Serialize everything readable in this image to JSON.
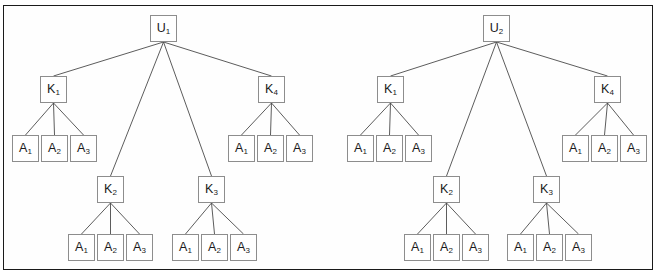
{
  "figure": {
    "frame": {
      "border_color": "#1a1a1a",
      "background": "#fefefe"
    },
    "node_style": {
      "border_color": "#8d8d8d",
      "fill": "#ffffff",
      "text_color": "#1a1a1a",
      "edge_color": "#4a4a4a"
    },
    "trees": [
      {
        "id": "tree-left",
        "root": {
          "id": "u1",
          "label": "U",
          "sub": "1",
          "x": 150,
          "y": 15
        },
        "k_nodes": [
          {
            "id": "l-k1",
            "label": "K",
            "sub": "1",
            "x": 40,
            "y": 76,
            "children": [
              {
                "label": "A",
                "sub": "1",
                "x": 12,
                "y": 135
              },
              {
                "label": "A",
                "sub": "2",
                "x": 41,
                "y": 135
              },
              {
                "label": "A",
                "sub": "3",
                "x": 70,
                "y": 135
              }
            ]
          },
          {
            "id": "l-k2",
            "label": "K",
            "sub": "2",
            "x": 97,
            "y": 176,
            "children": [
              {
                "label": "A",
                "sub": "1",
                "x": 68,
                "y": 234
              },
              {
                "label": "A",
                "sub": "2",
                "x": 97,
                "y": 234
              },
              {
                "label": "A",
                "sub": "3",
                "x": 126,
                "y": 234
              }
            ]
          },
          {
            "id": "l-k3",
            "label": "K",
            "sub": "3",
            "x": 198,
            "y": 176,
            "children": [
              {
                "label": "A",
                "sub": "1",
                "x": 172,
                "y": 234
              },
              {
                "label": "A",
                "sub": "2",
                "x": 201,
                "y": 234
              },
              {
                "label": "A",
                "sub": "3",
                "x": 230,
                "y": 234
              }
            ]
          },
          {
            "id": "l-k4",
            "label": "K",
            "sub": "4",
            "x": 258,
            "y": 76,
            "children": [
              {
                "label": "A",
                "sub": "1",
                "x": 228,
                "y": 135
              },
              {
                "label": "A",
                "sub": "2",
                "x": 257,
                "y": 135
              },
              {
                "label": "A",
                "sub": "3",
                "x": 286,
                "y": 135
              }
            ]
          }
        ]
      },
      {
        "id": "tree-right",
        "root": {
          "id": "u2",
          "label": "U",
          "sub": "2",
          "x": 483,
          "y": 15
        },
        "k_nodes": [
          {
            "id": "r-k1",
            "label": "K",
            "sub": "1",
            "x": 377,
            "y": 76,
            "children": [
              {
                "label": "A",
                "sub": "1",
                "x": 347,
                "y": 135
              },
              {
                "label": "A",
                "sub": "2",
                "x": 376,
                "y": 135
              },
              {
                "label": "A",
                "sub": "3",
                "x": 405,
                "y": 135
              }
            ]
          },
          {
            "id": "r-k2",
            "label": "K",
            "sub": "2",
            "x": 433,
            "y": 176,
            "children": [
              {
                "label": "A",
                "sub": "1",
                "x": 404,
                "y": 234
              },
              {
                "label": "A",
                "sub": "2",
                "x": 433,
                "y": 234
              },
              {
                "label": "A",
                "sub": "3",
                "x": 462,
                "y": 234
              }
            ]
          },
          {
            "id": "r-k3",
            "label": "K",
            "sub": "3",
            "x": 533,
            "y": 176,
            "children": [
              {
                "label": "A",
                "sub": "1",
                "x": 507,
                "y": 234
              },
              {
                "label": "A",
                "sub": "2",
                "x": 536,
                "y": 234
              },
              {
                "label": "A",
                "sub": "3",
                "x": 565,
                "y": 234
              }
            ]
          },
          {
            "id": "r-k4",
            "label": "K",
            "sub": "4",
            "x": 594,
            "y": 76,
            "children": [
              {
                "label": "A",
                "sub": "1",
                "x": 562,
                "y": 135
              },
              {
                "label": "A",
                "sub": "2",
                "x": 591,
                "y": 135
              },
              {
                "label": "A",
                "sub": "3",
                "x": 620,
                "y": 135
              }
            ]
          }
        ]
      }
    ]
  }
}
